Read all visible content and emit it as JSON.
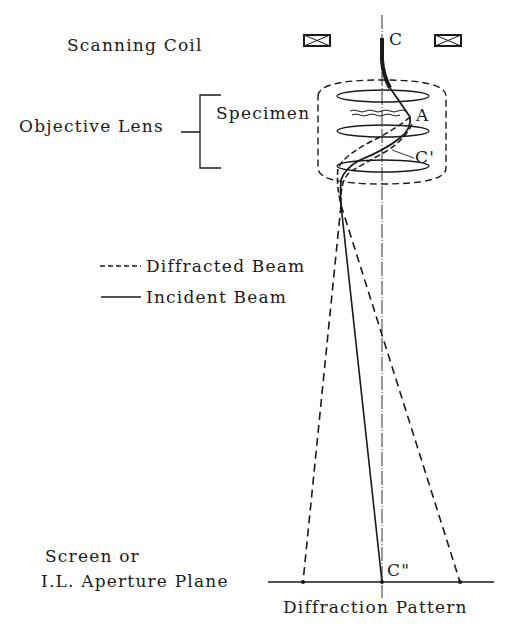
{
  "labels": {
    "scanning_coil": "Scanning Coil",
    "objective_lens": "Objective Lens",
    "specimen": "Specimen",
    "point_c": "C",
    "point_a": "A",
    "point_c_prime": "C'",
    "point_c_double_prime": "C\"",
    "screen_line1": "Screen or",
    "screen_line2": "I.L. Aperture Plane",
    "diffraction_pattern": "Diffraction Pattern"
  },
  "legend": {
    "items": [
      {
        "style": "dashed",
        "label": "Diffracted Beam"
      },
      {
        "style": "solid",
        "label": "Incident Beam"
      }
    ]
  },
  "colors": {
    "ink": "#1a1a1a",
    "background": "#ffffff"
  }
}
